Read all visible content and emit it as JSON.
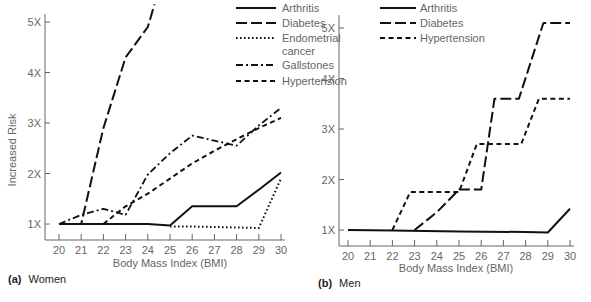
{
  "chart_data": [
    {
      "type": "line",
      "panel_tag": "(a)",
      "panel_name": "Women",
      "title": "",
      "xlabel": "Body Mass Index (BMI)",
      "ylabel": "Increased Risk",
      "x_ticks": [
        "20",
        "21",
        "22",
        "23",
        "24",
        "25",
        "26",
        "27",
        "28",
        "29",
        "30"
      ],
      "y_ticks": [
        "1X",
        "2X",
        "3X",
        "4X",
        "5X"
      ],
      "xlim": [
        20,
        30
      ],
      "ylim": [
        0.9,
        5.3
      ],
      "grid": false,
      "legend_position": "top-right",
      "series": [
        {
          "name": "Arthritis",
          "style": "solid",
          "points": [
            [
              20,
              1
            ],
            [
              21,
              1
            ],
            [
              22,
              1
            ],
            [
              23,
              1
            ],
            [
              24,
              1
            ],
            [
              25,
              0.97
            ],
            [
              26,
              1.35
            ],
            [
              27,
              1.35
            ],
            [
              28,
              1.35
            ],
            [
              29,
              1.68
            ],
            [
              30,
              2.02
            ]
          ]
        },
        {
          "name": "Diabetes",
          "style": "long-dash",
          "points": [
            [
              20,
              1
            ],
            [
              21,
              1
            ],
            [
              22,
              2.9
            ],
            [
              23,
              4.3
            ],
            [
              24,
              4.9
            ],
            [
              24.3,
              5.35
            ]
          ]
        },
        {
          "name": "Endometrial cancer",
          "style": "dotted",
          "points": [
            [
              25,
              0.95
            ],
            [
              26,
              0.95
            ],
            [
              27,
              0.94
            ],
            [
              28,
              0.93
            ],
            [
              29,
              0.92
            ],
            [
              30,
              1.9
            ]
          ]
        },
        {
          "name": "Gallstones",
          "style": "dash-dot",
          "points": [
            [
              20,
              1
            ],
            [
              21,
              1.18
            ],
            [
              22,
              1.3
            ],
            [
              23,
              1.18
            ],
            [
              24,
              1.98
            ],
            [
              25,
              2.4
            ],
            [
              26,
              2.75
            ],
            [
              27,
              2.65
            ],
            [
              28,
              2.55
            ],
            [
              29,
              2.95
            ],
            [
              30,
              3.3
            ]
          ]
        },
        {
          "name": "Hypertension",
          "style": "short-dash",
          "points": [
            [
              22,
              1
            ],
            [
              23,
              1.35
            ],
            [
              24,
              1.6
            ],
            [
              25,
              1.9
            ],
            [
              26,
              2.2
            ],
            [
              27,
              2.45
            ],
            [
              28,
              2.68
            ],
            [
              29,
              2.9
            ],
            [
              30,
              3.1
            ]
          ]
        }
      ]
    },
    {
      "type": "line",
      "panel_tag": "(b)",
      "panel_name": "Men",
      "title": "",
      "xlabel": "Body Mass Index (BMI)",
      "ylabel": "",
      "x_ticks": [
        "20",
        "21",
        "22",
        "23",
        "24",
        "25",
        "26",
        "27",
        "28",
        "29",
        "30"
      ],
      "y_ticks": [
        "1X",
        "2X",
        "3X",
        "4X",
        "5X"
      ],
      "xlim": [
        20,
        30
      ],
      "ylim": [
        0.9,
        5.3
      ],
      "grid": false,
      "legend_position": "top-left",
      "series": [
        {
          "name": "Arthritis",
          "style": "solid",
          "points": [
            [
              20,
              1
            ],
            [
              22,
              0.99
            ],
            [
              25,
              0.97
            ],
            [
              28,
              0.96
            ],
            [
              29,
              0.95
            ],
            [
              30,
              1.42
            ]
          ]
        },
        {
          "name": "Diabetes",
          "style": "long-dash",
          "points": [
            [
              23,
              1
            ],
            [
              24,
              1.35
            ],
            [
              25,
              1.8
            ],
            [
              26,
              1.8
            ],
            [
              26.6,
              3.6
            ],
            [
              27.7,
              3.6
            ],
            [
              28.8,
              5.1
            ],
            [
              30,
              5.1
            ]
          ]
        },
        {
          "name": "Hypertension",
          "style": "short-dash",
          "points": [
            [
              22,
              1
            ],
            [
              22.8,
              1.75
            ],
            [
              25,
              1.75
            ],
            [
              25.8,
              2.7
            ],
            [
              27.8,
              2.7
            ],
            [
              28.6,
              3.6
            ],
            [
              30,
              3.6
            ]
          ]
        }
      ]
    }
  ]
}
